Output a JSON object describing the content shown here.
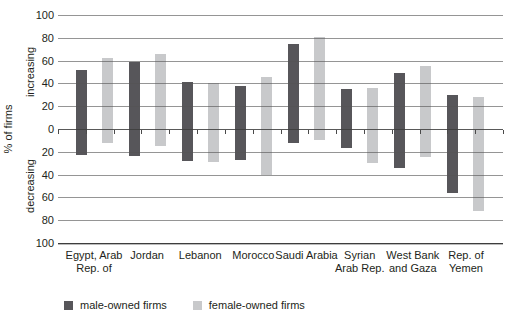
{
  "figure": {
    "upper_label": "increasing",
    "lower_label": "decreasing",
    "colors": {
      "male_bar": "#57565a",
      "female_bar": "#c8c9cb",
      "gridline": "#545454",
      "text": "#231f20"
    }
  },
  "chart_data": {
    "type": "bar",
    "subtype": "diverging-range-bars",
    "title": "",
    "ylabel": "% of firms",
    "upper_region_label": "increasing",
    "lower_region_label": "decreasing",
    "ylim": [
      -100,
      100
    ],
    "grid": true,
    "legend_position": "bottom-left",
    "yticks_display": [
      "100",
      "80",
      "60",
      "40",
      "20",
      "0",
      "20",
      "40",
      "60",
      "80",
      "100"
    ],
    "ytick_values": [
      100,
      80,
      60,
      40,
      20,
      0,
      -20,
      -40,
      -60,
      -80,
      -100
    ],
    "categories": [
      "Egypt, Arab Rep. of",
      "Jordan",
      "Lebanon",
      "Morocco",
      "Saudi Arabia",
      "Syrian Arab Rep.",
      "West Bank and Gaza",
      "Rep. of Yemen"
    ],
    "category_lines": [
      [
        "Egypt, Arab",
        "Rep. of"
      ],
      [
        "Jordan"
      ],
      [
        "Lebanon"
      ],
      [
        "Morocco"
      ],
      [
        "Saudi Arabia"
      ],
      [
        "Syrian",
        "Arab Rep."
      ],
      [
        "West Bank",
        "and Gaza"
      ],
      [
        "Rep. of",
        "Yemen"
      ]
    ],
    "series": [
      {
        "name": "male-owned firms",
        "color": "#57565a",
        "increasing": [
          52,
          59,
          41,
          38,
          75,
          35,
          49,
          30
        ],
        "decreasing": [
          -23,
          -24,
          -28,
          -27,
          -12,
          -17,
          -34,
          -56
        ]
      },
      {
        "name": "female-owned firms",
        "color": "#c8c9cb",
        "increasing": [
          62,
          66,
          40,
          46,
          81,
          36,
          55,
          28
        ],
        "decreasing": [
          -12,
          -15,
          -29,
          -40,
          -10,
          -30,
          -25,
          -72
        ]
      }
    ]
  }
}
